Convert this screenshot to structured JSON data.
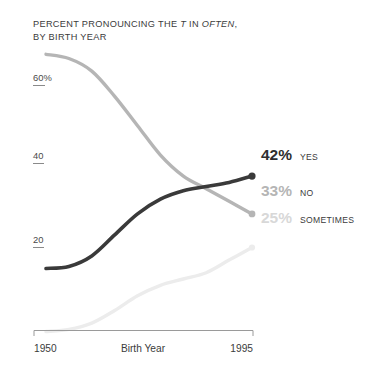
{
  "title": {
    "line1_pre": "PERCENT PRONOUNCING THE ",
    "line1_ital1": "T",
    "line1_mid": " IN ",
    "line1_ital2": "OFTEN",
    "line1_post": ",",
    "line2": "BY BIRTH YEAR"
  },
  "axis": {
    "x_title": "Birth Year",
    "x_min_label": "1950",
    "x_max_label": "1995",
    "y_ticks": [
      "60%",
      "40",
      "20"
    ]
  },
  "colors": {
    "yes": "#3a3a3a",
    "no": "#b5b5b5",
    "sometimes": "#ececec",
    "sometimes_label": "#d8d8d8",
    "text": "#3b3b3b",
    "background": "#ffffff"
  },
  "chart_data": {
    "type": "line",
    "title": "PERCENT PRONOUNCING THE T IN OFTEN, BY BIRTH YEAR",
    "xlabel": "Birth Year",
    "ylabel": "",
    "xlim": [
      1950,
      1995
    ],
    "ylim": [
      0,
      75
    ],
    "grid": false,
    "legend": "end-of-line labels",
    "x": [
      1950,
      1955,
      1960,
      1965,
      1970,
      1975,
      1980,
      1985,
      1990,
      1995
    ],
    "series": [
      {
        "name": "YES",
        "color": "#3a3a3a",
        "end_value_label": "42%",
        "values": [
          20,
          20.5,
          23,
          28,
          33,
          36.5,
          38.5,
          39.5,
          40.5,
          42
        ]
      },
      {
        "name": "NO",
        "color": "#b5b5b5",
        "end_value_label": "33%",
        "values": [
          71,
          70,
          67,
          61,
          54,
          47,
          42,
          39,
          36,
          33
        ]
      },
      {
        "name": "SOMETIMES",
        "color": "#ececec",
        "end_value_label": "25%",
        "values": [
          5,
          5.5,
          7,
          10,
          13.5,
          16,
          17.5,
          19,
          22,
          25
        ]
      }
    ]
  },
  "end_labels": [
    {
      "value": "42%",
      "name": "YES"
    },
    {
      "value": "33%",
      "name": "NO"
    },
    {
      "value": "25%",
      "name": "SOMETIMES"
    }
  ]
}
